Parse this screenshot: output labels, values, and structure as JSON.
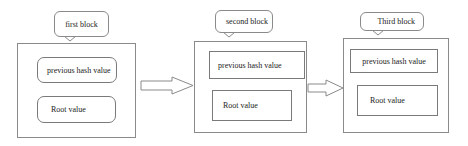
{
  "diagram": {
    "type": "blockchain-block-sequence",
    "blocks": [
      {
        "label": "first block",
        "fields": [
          "previous hash value",
          "Root value"
        ]
      },
      {
        "label": "second block",
        "fields": [
          "previous hash value",
          "Root value"
        ]
      },
      {
        "label": "Third block",
        "fields": [
          "previous hash value",
          "Root value"
        ]
      }
    ],
    "edges": [
      {
        "from": "first block",
        "to": "second block"
      },
      {
        "from": "second block",
        "to": "Third block"
      }
    ],
    "colors": {
      "stroke": "#8a8a8a",
      "text": "#222222",
      "background": "#ffffff"
    }
  }
}
